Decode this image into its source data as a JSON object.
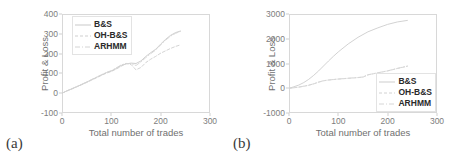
{
  "figure": {
    "panels": [
      {
        "tag": "(a)",
        "chart_data": {
          "type": "line",
          "title": "",
          "xlabel": "Total number of trades",
          "ylabel": "Profit & Loss",
          "xlim": [
            0,
            300
          ],
          "ylim": [
            -100,
            400
          ],
          "xticks": [
            0,
            100,
            200,
            300
          ],
          "yticks": [
            -100,
            0,
            100,
            200,
            300,
            400
          ],
          "grid": false,
          "legend_position": "upper-left",
          "legend": [
            "B&S",
            "OH-B&S",
            "ARHMM"
          ],
          "series": [
            {
              "name": "B&S",
              "style": "solid",
              "color": "#c9c9c9",
              "x": [
                0,
                10,
                20,
                30,
                40,
                50,
                60,
                70,
                80,
                90,
                100,
                110,
                120,
                130,
                140,
                150,
                160,
                170,
                180,
                190,
                200,
                210,
                220,
                230,
                240
              ],
              "y": [
                0,
                12,
                22,
                33,
                44,
                56,
                68,
                80,
                92,
                104,
                112,
                125,
                140,
                148,
                152,
                150,
                163,
                186,
                205,
                222,
                248,
                272,
                292,
                306,
                314
              ]
            },
            {
              "name": "OH-B&S",
              "style": "dashed",
              "color": "#cfcfcf",
              "x": [
                0,
                10,
                20,
                30,
                40,
                50,
                60,
                70,
                80,
                90,
                100,
                110,
                120,
                130,
                140,
                150,
                160,
                170,
                180,
                190,
                200,
                210,
                220,
                230,
                240
              ],
              "y": [
                0,
                11,
                21,
                32,
                43,
                54,
                66,
                78,
                90,
                101,
                110,
                122,
                136,
                150,
                145,
                118,
                130,
                155,
                172,
                186,
                202,
                214,
                226,
                236,
                244
              ]
            },
            {
              "name": "ARHMM",
              "style": "dashdot",
              "color": "#d4d4d4",
              "x": [
                0,
                10,
                20,
                30,
                40,
                50,
                60,
                70,
                80,
                90,
                100,
                110,
                120,
                130,
                140,
                150,
                160,
                170,
                180,
                190,
                200,
                210,
                220,
                230,
                240
              ],
              "y": [
                0,
                12,
                23,
                34,
                45,
                57,
                69,
                81,
                93,
                105,
                114,
                128,
                143,
                150,
                150,
                140,
                158,
                180,
                200,
                218,
                244,
                268,
                288,
                302,
                312
              ]
            }
          ]
        }
      },
      {
        "tag": "(b)",
        "chart_data": {
          "type": "line",
          "title": "",
          "xlabel": "Total number of trades",
          "ylabel": "Profit & Loss",
          "xlim": [
            0,
            300
          ],
          "ylim": [
            -1000,
            3000
          ],
          "xticks": [
            0,
            100,
            200,
            300
          ],
          "yticks": [
            -1000,
            0,
            1000,
            2000,
            3000
          ],
          "grid": false,
          "legend_position": "lower-right",
          "legend": [
            "B&S",
            "OH-B&S",
            "ARHMM"
          ],
          "series": [
            {
              "name": "B&S",
              "style": "solid",
              "color": "#cdcdcd",
              "x": [
                0,
                10,
                20,
                30,
                40,
                50,
                60,
                70,
                80,
                90,
                100,
                120,
                140,
                160,
                180,
                200,
                220,
                240
              ],
              "y": [
                0,
                60,
                130,
                230,
                360,
                520,
                700,
                900,
                1100,
                1290,
                1470,
                1790,
                2060,
                2280,
                2440,
                2580,
                2680,
                2740
              ]
            },
            {
              "name": "OH-B&S",
              "style": "dashed",
              "color": "#d2d2d2",
              "x": [
                0,
                10,
                20,
                30,
                40,
                50,
                60,
                70,
                80,
                90,
                100,
                120,
                140,
                150,
                160,
                180,
                200,
                220,
                240
              ],
              "y": [
                0,
                20,
                45,
                80,
                120,
                175,
                245,
                300,
                330,
                350,
                370,
                400,
                430,
                450,
                540,
                620,
                700,
                800,
                890
              ]
            },
            {
              "name": "ARHMM",
              "style": "dashdot",
              "color": "#d6d6d6",
              "x": [
                0,
                10,
                20,
                30,
                40,
                50,
                60,
                70,
                80,
                90,
                100,
                120,
                140,
                150,
                160,
                180,
                200,
                220,
                240
              ],
              "y": [
                0,
                22,
                48,
                85,
                125,
                180,
                250,
                305,
                335,
                355,
                375,
                405,
                435,
                455,
                545,
                625,
                705,
                805,
                895
              ]
            }
          ]
        }
      }
    ]
  }
}
